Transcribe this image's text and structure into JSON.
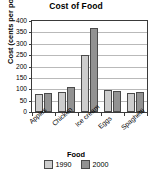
{
  "chart_data": {
    "type": "bar",
    "title": "Cost of Food",
    "xlabel": "Food",
    "ylabel": "Cost (cents per pound)",
    "categories": [
      "Apples",
      "Chicken",
      "Ice cream",
      "Eggs",
      "Spaghetti"
    ],
    "series": [
      {
        "name": "1990",
        "color": "#cdcdcd",
        "values": [
          78,
          87,
          252,
          98,
          82
        ]
      },
      {
        "name": "2000",
        "color": "#929292",
        "values": [
          82,
          108,
          368,
          94,
          87
        ]
      }
    ],
    "ylim": [
      0,
      400
    ],
    "yticks": [
      0,
      50,
      100,
      150,
      200,
      250,
      300,
      350,
      400
    ],
    "ytick_labels": [
      "0",
      "50",
      "100",
      "150",
      "200",
      "250",
      "300",
      "350",
      "400"
    ],
    "grid": true,
    "grid_axis": "y",
    "legend_position": "bottom",
    "legend_entries": [
      "1990",
      "2000"
    ]
  }
}
